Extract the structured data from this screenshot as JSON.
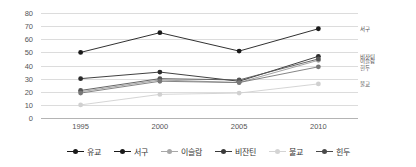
{
  "chart_data": {
    "type": "line",
    "title": "",
    "subtitle": "",
    "xlabel": "",
    "ylabel": "",
    "x": [
      "1995",
      "2000",
      "2005",
      "2010"
    ],
    "categories": [
      "1995",
      "2000",
      "2005",
      "2010"
    ],
    "ylim": [
      0,
      80
    ],
    "yticks": [
      "0",
      "10",
      "20",
      "30",
      "40",
      "50",
      "60",
      "70",
      "80"
    ],
    "ytick_values": [
      0,
      10,
      20,
      30,
      40,
      50,
      60,
      70,
      80
    ],
    "grid": true,
    "legend_position": "bottom",
    "series": [
      {
        "name": "유교",
        "values": [
          50,
          65,
          51,
          68
        ],
        "color": "#1a1a1a",
        "end_label": "서구"
      },
      {
        "name": "서구",
        "values": [
          30,
          35,
          28,
          47
        ],
        "color": "#2b2b2b",
        "end_label": "비잔틴"
      },
      {
        "name": "이슬람",
        "values": [
          20,
          29,
          27,
          44
        ],
        "color": "#9a9a9a",
        "end_label": "이슬람"
      },
      {
        "name": "비잔틴",
        "values": [
          21,
          30,
          29,
          45
        ],
        "color": "#555555",
        "end_label": "힌두"
      },
      {
        "name": "불교",
        "values": [
          10,
          18,
          19,
          26
        ],
        "color": "#d0d0d0",
        "end_label": "불교"
      },
      {
        "name": "힌두",
        "values": [
          19,
          28,
          27,
          39
        ],
        "color": "#777777",
        "end_label": ""
      }
    ],
    "point_labels": [
      {
        "text": "서구",
        "value": 68
      },
      {
        "text": "비잔틴",
        "value": 46.5
      },
      {
        "text": "이슬람",
        "value": 43.5
      },
      {
        "text": "힌두",
        "value": 38
      },
      {
        "text": "불교",
        "value": 26
      }
    ],
    "legend": [
      "유교",
      "서구",
      "이슬람",
      "비잔틴",
      "불교",
      "힌두"
    ],
    "legend_colors": [
      "#1a1a1a",
      "#1a1a1a",
      "#a8a8a8",
      "#3a3a3a",
      "#d4d4d4",
      "#4a4a4a"
    ]
  },
  "axis": {
    "y_ticks": [
      "80",
      "70",
      "60",
      "50",
      "40",
      "30",
      "20",
      "10",
      "0"
    ],
    "x_ticks": [
      "1995",
      "2000",
      "2005",
      "2010"
    ]
  },
  "colors": {
    "grid": "#dcdcdc",
    "axis": "#b4b4b4",
    "tick_text": "#555555",
    "background": "#ffffff"
  }
}
